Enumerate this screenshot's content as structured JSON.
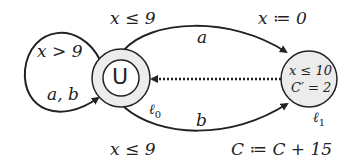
{
  "diagram": {
    "type": "timed-automaton",
    "states": [
      {
        "id": "l0",
        "inner_label": "U",
        "name_label": "ℓ0",
        "initial_urgent": true
      },
      {
        "id": "l1",
        "invariant": "x ≤ 10",
        "rate": "C′ = 2",
        "name_label": "ℓ1"
      }
    ],
    "edges": [
      {
        "from": "l0",
        "to": "l0",
        "guard": "x > 9",
        "action": "a, b"
      },
      {
        "from": "l0",
        "to": "l1",
        "guard": "x ≤ 9",
        "action": "a",
        "update": "x ≔ 0"
      },
      {
        "from": "l0",
        "to": "l1",
        "guard": "x ≤ 9",
        "action": "b",
        "update": "C ≔ C + 15"
      },
      {
        "from": "l1",
        "to": "l0",
        "style": "dotted"
      }
    ],
    "colors": {
      "stroke": "#222222",
      "state_fill": "#ececec",
      "background": "#ffffff"
    }
  },
  "labels": {
    "self_guard": "x > 9",
    "self_action": "a, b",
    "top_guard": "x ≤ 9",
    "top_action": "a",
    "top_update": "x ≔ 0",
    "bottom_guard": "x ≤ 9",
    "bottom_action": "b",
    "bottom_update": "C ≔ C + 15",
    "u_label": "U",
    "l0_name": "ℓ",
    "l0_sub": "0",
    "l1_name": "ℓ",
    "l1_sub": "1",
    "l1_invariant": "x ≤ 10",
    "l1_rate": "C′ = 2"
  }
}
